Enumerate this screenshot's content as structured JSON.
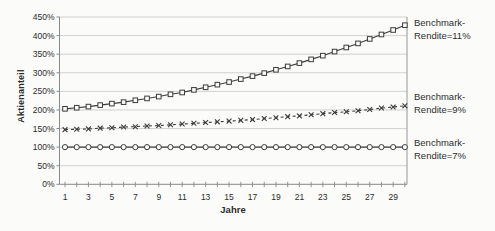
{
  "figure": {
    "ylabel": "Aktienanteil",
    "xlabel": "Jahre"
  },
  "annotations": {
    "s11": {
      "line1": "Benchmark-",
      "line2": "Rendite=11%"
    },
    "s9": {
      "line1": "Benchmark-",
      "line2": "Rendite=9%"
    },
    "s7": {
      "line1": "Benchmark-",
      "line2": "Rendite=7%"
    }
  },
  "chart_data": {
    "type": "line",
    "title": "",
    "xlabel": "Jahre",
    "ylabel": "Aktienanteil",
    "x": [
      1,
      2,
      3,
      4,
      5,
      6,
      7,
      8,
      9,
      10,
      11,
      12,
      13,
      14,
      15,
      16,
      17,
      18,
      19,
      20,
      21,
      22,
      23,
      24,
      25,
      26,
      27,
      28,
      29,
      30
    ],
    "x_tick_labels": [
      "1",
      "3",
      "5",
      "7",
      "9",
      "11",
      "13",
      "15",
      "17",
      "19",
      "21",
      "23",
      "25",
      "27",
      "29"
    ],
    "y_ticks": [
      0,
      50,
      100,
      150,
      200,
      250,
      300,
      350,
      400,
      450
    ],
    "y_tick_labels": [
      "0%",
      "50%",
      "100%",
      "150%",
      "200%",
      "250%",
      "300%",
      "350%",
      "400%",
      "450%"
    ],
    "ylim": [
      0,
      450
    ],
    "grid": true,
    "legend_position": "right-annotations",
    "series": [
      {
        "name": "Benchmark-Rendite=11%",
        "marker": "square",
        "line": "solid",
        "values": [
          203,
          206,
          209,
          213,
          217,
          221,
          226,
          231,
          236,
          242,
          247,
          254,
          261,
          268,
          275,
          283,
          291,
          299,
          308,
          317,
          326,
          336,
          346,
          357,
          368,
          379,
          391,
          403,
          415,
          428
        ]
      },
      {
        "name": "Benchmark-Rendite=9%",
        "marker": "x",
        "line": "dashed",
        "values": [
          147,
          148,
          149,
          151,
          152,
          154,
          155,
          157,
          158,
          160,
          162,
          164,
          166,
          168,
          170,
          172,
          174,
          177,
          179,
          182,
          184,
          187,
          190,
          193,
          195,
          198,
          201,
          205,
          208,
          211
        ]
      },
      {
        "name": "Benchmark-Rendite=7%",
        "marker": "circle",
        "line": "solid",
        "values": [
          100,
          100,
          100,
          100,
          100,
          100,
          100,
          100,
          100,
          100,
          100,
          100,
          100,
          100,
          100,
          100,
          100,
          100,
          100,
          100,
          100,
          100,
          100,
          100,
          100,
          100,
          100,
          100,
          100,
          100
        ]
      }
    ],
    "colors": {
      "series": "#3c3c3c",
      "grid": "#c6c6c6",
      "axis": "#8a8a8a",
      "text": "#2b2b2b",
      "marker_fill": "#fbfbf9"
    }
  }
}
